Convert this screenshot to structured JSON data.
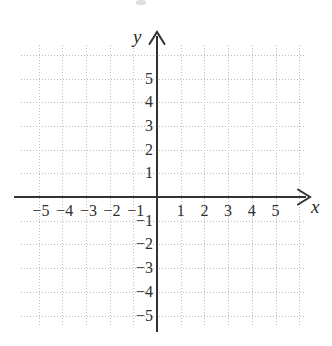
{
  "chart_data": {
    "type": "scatter",
    "title": "",
    "subtitle": "",
    "xlabel": "x",
    "ylabel": "y",
    "xlim": [
      -5.65,
      6.2
    ],
    "ylim": [
      -6.3,
      6.3
    ],
    "x_ticks": [
      -5,
      -4,
      -3,
      -2,
      -1,
      1,
      2,
      3,
      4,
      5
    ],
    "y_ticks": [
      5,
      4,
      3,
      2,
      1,
      -1,
      -2,
      -3,
      -4,
      -5
    ],
    "x_tick_labels": [
      "−5",
      "−4",
      "−3",
      "−2",
      "−1",
      "1",
      "2",
      "3",
      "4",
      "5"
    ],
    "y_tick_labels": [
      "5",
      "4",
      "3",
      "2",
      "1",
      "−1",
      "−2",
      "−3",
      "−4",
      "−5"
    ],
    "grid": true,
    "grid_style": "dotted",
    "grid_step": 1,
    "legend": null,
    "series": [],
    "values": [],
    "categories": [],
    "annotations": [],
    "axis_arrows": [
      "x-positive",
      "y-positive"
    ],
    "origin_label": ""
  },
  "figure": {
    "name": "blank-cartesian-coordinate-plane",
    "axes": {
      "x_axis_name": "x",
      "y_axis_name": "y"
    },
    "colors": {
      "background": "#ffffff",
      "axis": "#333333",
      "grid": "#bdbdbd",
      "text": "#2f2f2f"
    }
  }
}
